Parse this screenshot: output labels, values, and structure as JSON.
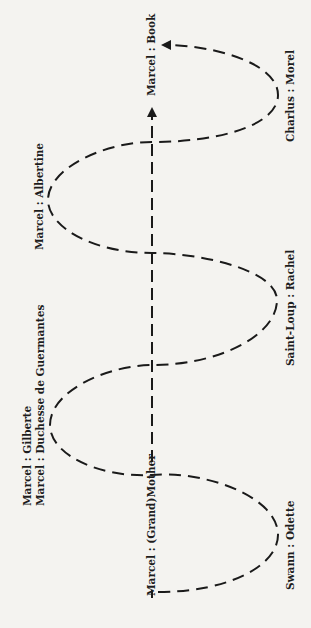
{
  "diagram": {
    "type": "spiral-oscillation",
    "stroke_color": "#1a1a1a",
    "background": "#f4f3f0",
    "axis": {
      "start_label": "Marcel : (Grand)Mother",
      "end_label": "Marcel : Book"
    },
    "left_nodes": [
      {
        "lines": [
          "Marcel : Gilberte",
          "Marcel : Duchesse de Guermantes"
        ]
      },
      {
        "lines": [
          "Marcel : Albertine"
        ]
      }
    ],
    "right_nodes": [
      {
        "label": "Swann : Odette"
      },
      {
        "label": "Saint-Loup : Rachel"
      },
      {
        "label": "Charlus : Morel"
      }
    ]
  }
}
